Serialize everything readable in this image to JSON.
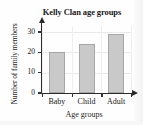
{
  "scan": {
    "header_fragment": "",
    "background_color": "#fefefe"
  },
  "chart_data": {
    "type": "bar",
    "title": "Kelly Clan age groups",
    "xlabel": "Age groups",
    "ylabel": "Number of family members",
    "categories": [
      "Baby",
      "Child",
      "Adult"
    ],
    "values": [
      20,
      24,
      29
    ],
    "ylim": [
      0,
      33
    ],
    "yticks": [
      0,
      10,
      20,
      30
    ],
    "ytick_labels": [
      "0",
      "10",
      "20",
      "30"
    ],
    "grid": true,
    "legend": null,
    "bar_color": "#c9c9c9",
    "bar_edge_color": "#a6a6a6",
    "axis_color": "#2b2b2b",
    "grid_color": "#e9e9e9"
  }
}
